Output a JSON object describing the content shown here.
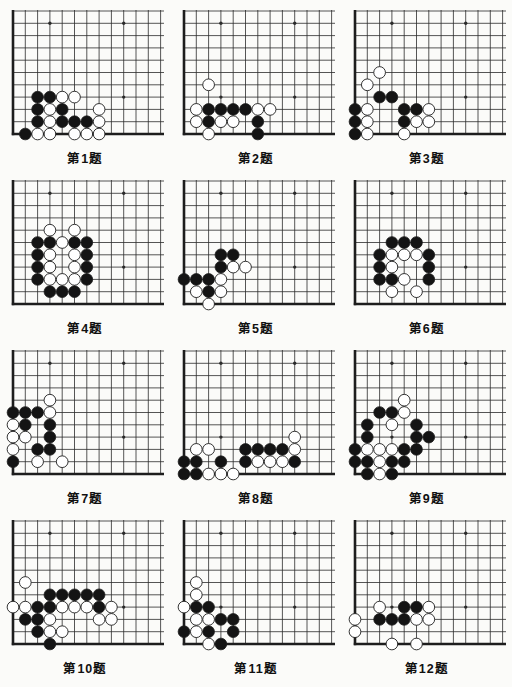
{
  "board": {
    "cols": 13,
    "rows": 11,
    "stars": [
      [
        4,
        4
      ],
      [
        10,
        4
      ],
      [
        4,
        10
      ],
      [
        10,
        10
      ]
    ],
    "line_color": "#2b2b2b",
    "edge_color": "#1d1d1d",
    "black_color": "#141414",
    "white_color": "#ffffff",
    "stone_outline": "#1d1d1d"
  },
  "problems": [
    {
      "label": "第1题",
      "black": [
        [
          3,
          4
        ],
        [
          4,
          4
        ],
        [
          3,
          3
        ],
        [
          5,
          3
        ],
        [
          3,
          2
        ],
        [
          5,
          2
        ],
        [
          6,
          2
        ],
        [
          7,
          2
        ],
        [
          2,
          1
        ]
      ],
      "white": [
        [
          5,
          4
        ],
        [
          6,
          4
        ],
        [
          4,
          3
        ],
        [
          8,
          3
        ],
        [
          4,
          2
        ],
        [
          8,
          2
        ],
        [
          3,
          1
        ],
        [
          4,
          1
        ],
        [
          6,
          1
        ],
        [
          7,
          1
        ],
        [
          8,
          1
        ]
      ]
    },
    {
      "label": "第2题",
      "black": [
        [
          3,
          3
        ],
        [
          4,
          3
        ],
        [
          5,
          3
        ],
        [
          6,
          3
        ],
        [
          3,
          2
        ],
        [
          7,
          2
        ],
        [
          7,
          1
        ]
      ],
      "white": [
        [
          3,
          5
        ],
        [
          2,
          3
        ],
        [
          7,
          3
        ],
        [
          8,
          3
        ],
        [
          2,
          2
        ],
        [
          4,
          2
        ],
        [
          5,
          2
        ],
        [
          3,
          1
        ]
      ]
    },
    {
      "label": "第3题",
      "black": [
        [
          3,
          4
        ],
        [
          4,
          4
        ],
        [
          1,
          3
        ],
        [
          5,
          3
        ],
        [
          6,
          3
        ],
        [
          1,
          2
        ],
        [
          5,
          2
        ],
        [
          1,
          1
        ]
      ],
      "white": [
        [
          3,
          6
        ],
        [
          2,
          5
        ],
        [
          2,
          3
        ],
        [
          7,
          3
        ],
        [
          2,
          2
        ],
        [
          6,
          2
        ],
        [
          7,
          2
        ],
        [
          2,
          1
        ],
        [
          5,
          1
        ]
      ]
    },
    {
      "label": "第4题",
      "black": [
        [
          3,
          6
        ],
        [
          4,
          6
        ],
        [
          6,
          6
        ],
        [
          7,
          6
        ],
        [
          3,
          5
        ],
        [
          7,
          5
        ],
        [
          3,
          4
        ],
        [
          7,
          4
        ],
        [
          3,
          3
        ],
        [
          7,
          3
        ],
        [
          4,
          2
        ],
        [
          5,
          2
        ],
        [
          6,
          2
        ]
      ],
      "white": [
        [
          4,
          7
        ],
        [
          6,
          7
        ],
        [
          5,
          6
        ],
        [
          4,
          5
        ],
        [
          6,
          5
        ],
        [
          4,
          4
        ],
        [
          6,
          4
        ],
        [
          4,
          3
        ],
        [
          5,
          3
        ],
        [
          6,
          3
        ]
      ]
    },
    {
      "label": "第5题",
      "black": [
        [
          4,
          5
        ],
        [
          5,
          5
        ],
        [
          4,
          4
        ],
        [
          1,
          3
        ],
        [
          2,
          3
        ],
        [
          3,
          3
        ],
        [
          3,
          2
        ]
      ],
      "white": [
        [
          5,
          4
        ],
        [
          6,
          4
        ],
        [
          4,
          3
        ],
        [
          2,
          2
        ],
        [
          4,
          2
        ],
        [
          3,
          1
        ]
      ]
    },
    {
      "label": "第6题",
      "black": [
        [
          4,
          6
        ],
        [
          5,
          6
        ],
        [
          6,
          6
        ],
        [
          3,
          5
        ],
        [
          7,
          5
        ],
        [
          3,
          4
        ],
        [
          7,
          4
        ],
        [
          3,
          3
        ],
        [
          4,
          3
        ],
        [
          7,
          3
        ]
      ],
      "white": [
        [
          4,
          5
        ],
        [
          5,
          5
        ],
        [
          6,
          5
        ],
        [
          4,
          4
        ],
        [
          5,
          3
        ],
        [
          4,
          2
        ],
        [
          6,
          2
        ]
      ]
    },
    {
      "label": "第7题",
      "black": [
        [
          1,
          6
        ],
        [
          2,
          6
        ],
        [
          3,
          6
        ],
        [
          2,
          5
        ],
        [
          4,
          5
        ],
        [
          4,
          4
        ],
        [
          3,
          3
        ],
        [
          4,
          3
        ],
        [
          1,
          2
        ]
      ],
      "white": [
        [
          4,
          7
        ],
        [
          4,
          6
        ],
        [
          1,
          5
        ],
        [
          1,
          4
        ],
        [
          2,
          4
        ],
        [
          1,
          3
        ],
        [
          3,
          2
        ],
        [
          5,
          2
        ]
      ]
    },
    {
      "label": "第8题",
      "black": [
        [
          6,
          3
        ],
        [
          7,
          3
        ],
        [
          8,
          3
        ],
        [
          9,
          3
        ],
        [
          1,
          2
        ],
        [
          2,
          2
        ],
        [
          4,
          2
        ],
        [
          6,
          2
        ],
        [
          10,
          2
        ],
        [
          1,
          1
        ],
        [
          2,
          1
        ]
      ],
      "white": [
        [
          10,
          4
        ],
        [
          2,
          3
        ],
        [
          3,
          3
        ],
        [
          10,
          3
        ],
        [
          7,
          2
        ],
        [
          8,
          2
        ],
        [
          9,
          2
        ],
        [
          3,
          1
        ],
        [
          4,
          1
        ],
        [
          5,
          1
        ]
      ]
    },
    {
      "label": "第9题",
      "black": [
        [
          3,
          6
        ],
        [
          4,
          6
        ],
        [
          2,
          5
        ],
        [
          6,
          5
        ],
        [
          2,
          4
        ],
        [
          6,
          4
        ],
        [
          7,
          4
        ],
        [
          1,
          3
        ],
        [
          5,
          3
        ],
        [
          6,
          3
        ],
        [
          1,
          2
        ],
        [
          2,
          2
        ],
        [
          4,
          2
        ],
        [
          5,
          2
        ],
        [
          2,
          1
        ],
        [
          4,
          1
        ]
      ],
      "white": [
        [
          5,
          7
        ],
        [
          5,
          6
        ],
        [
          4,
          5
        ],
        [
          2,
          3
        ],
        [
          3,
          3
        ],
        [
          4,
          3
        ],
        [
          3,
          2
        ],
        [
          3,
          1
        ]
      ]
    },
    {
      "label": "第10题",
      "black": [
        [
          4,
          5
        ],
        [
          5,
          5
        ],
        [
          6,
          5
        ],
        [
          7,
          5
        ],
        [
          8,
          5
        ],
        [
          3,
          4
        ],
        [
          4,
          4
        ],
        [
          8,
          4
        ],
        [
          2,
          3
        ],
        [
          3,
          3
        ],
        [
          3,
          2
        ],
        [
          4,
          1
        ]
      ],
      "white": [
        [
          2,
          6
        ],
        [
          1,
          4
        ],
        [
          2,
          4
        ],
        [
          5,
          4
        ],
        [
          6,
          4
        ],
        [
          7,
          4
        ],
        [
          9,
          4
        ],
        [
          4,
          3
        ],
        [
          8,
          3
        ],
        [
          9,
          3
        ],
        [
          4,
          2
        ],
        [
          5,
          2
        ]
      ]
    },
    {
      "label": "第11题",
      "black": [
        [
          2,
          4
        ],
        [
          3,
          4
        ],
        [
          4,
          3
        ],
        [
          5,
          3
        ],
        [
          1,
          2
        ],
        [
          3,
          2
        ],
        [
          5,
          2
        ],
        [
          4,
          1
        ]
      ],
      "white": [
        [
          2,
          6
        ],
        [
          2,
          5
        ],
        [
          1,
          4
        ],
        [
          2,
          3
        ],
        [
          3,
          3
        ],
        [
          2,
          2
        ],
        [
          3,
          1
        ]
      ]
    },
    {
      "label": "第12题",
      "black": [
        [
          5,
          4
        ],
        [
          6,
          4
        ],
        [
          3,
          3
        ],
        [
          4,
          3
        ],
        [
          5,
          3
        ]
      ],
      "white": [
        [
          3,
          4
        ],
        [
          7,
          4
        ],
        [
          1,
          3
        ],
        [
          6,
          3
        ],
        [
          7,
          3
        ],
        [
          1,
          2
        ],
        [
          4,
          1
        ],
        [
          6,
          1
        ]
      ]
    }
  ]
}
